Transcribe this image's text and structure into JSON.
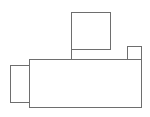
{
  "diagram": {
    "stroke_color": "#6e6e6e",
    "background": "#ffffff",
    "shapes": [
      {
        "id": "main-body",
        "kind": "rect",
        "x": 29,
        "y": 59,
        "w": 113,
        "h": 49
      },
      {
        "id": "left-block",
        "kind": "rect",
        "x": 10,
        "y": 65,
        "w": 20,
        "h": 38
      },
      {
        "id": "top-block",
        "kind": "rect",
        "x": 71,
        "y": 12,
        "w": 40,
        "h": 38
      },
      {
        "id": "top-right-block",
        "kind": "rect",
        "x": 127,
        "y": 46,
        "w": 15,
        "h": 14
      }
    ],
    "connectors": [
      {
        "id": "top-block-stem",
        "x": 71,
        "y": 49,
        "w": 1,
        "h": 11
      }
    ]
  }
}
